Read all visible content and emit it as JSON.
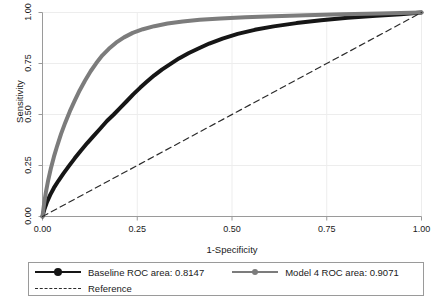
{
  "chart_data": {
    "type": "line",
    "title": "",
    "xlabel": "1-Specificity",
    "ylabel": "Sensitivity",
    "xlim": [
      0,
      1
    ],
    "ylim": [
      0,
      1
    ],
    "xticks": [
      "0.00",
      "0.25",
      "0.50",
      "0.75",
      "1.00"
    ],
    "xtick_values": [
      0,
      0.25,
      0.5,
      0.75,
      1
    ],
    "yticks": [
      "0.00",
      "0.25",
      "0.50",
      "0.75",
      "1.00"
    ],
    "ytick_values": [
      0,
      0.25,
      0.5,
      0.75,
      1
    ],
    "grid": true,
    "legend_position": "below",
    "series": [
      {
        "name": "Baseline ROC area: 0.8147",
        "area": 0.8147,
        "color": "#161616",
        "style": "solid",
        "marker": "circle",
        "x": [
          0.0,
          0.005,
          0.012,
          0.02,
          0.03,
          0.042,
          0.055,
          0.07,
          0.085,
          0.1,
          0.118,
          0.135,
          0.152,
          0.17,
          0.188,
          0.205,
          0.222,
          0.24,
          0.258,
          0.275,
          0.295,
          0.315,
          0.338,
          0.36,
          0.385,
          0.41,
          0.44,
          0.475,
          0.515,
          0.56,
          0.61,
          0.67,
          0.735,
          0.805,
          0.88,
          0.945,
          1.0
        ],
        "y": [
          0.0,
          0.035,
          0.072,
          0.105,
          0.14,
          0.175,
          0.21,
          0.248,
          0.285,
          0.32,
          0.36,
          0.395,
          0.43,
          0.468,
          0.5,
          0.533,
          0.565,
          0.6,
          0.632,
          0.66,
          0.692,
          0.72,
          0.748,
          0.775,
          0.8,
          0.822,
          0.848,
          0.872,
          0.895,
          0.915,
          0.932,
          0.948,
          0.962,
          0.974,
          0.984,
          0.992,
          1.0
        ]
      },
      {
        "name": "Model 4 ROC area: 0.9071",
        "area": 0.9071,
        "color": "#7c7c7c",
        "style": "solid",
        "marker": "circle",
        "x": [
          0.0,
          0.004,
          0.009,
          0.015,
          0.022,
          0.03,
          0.039,
          0.049,
          0.06,
          0.072,
          0.085,
          0.098,
          0.112,
          0.127,
          0.142,
          0.158,
          0.175,
          0.194,
          0.215,
          0.238,
          0.265,
          0.295,
          0.33,
          0.37,
          0.415,
          0.47,
          0.535,
          0.61,
          0.695,
          0.79,
          0.89,
          1.0
        ],
        "y": [
          0.0,
          0.06,
          0.12,
          0.178,
          0.235,
          0.292,
          0.348,
          0.405,
          0.46,
          0.515,
          0.568,
          0.618,
          0.665,
          0.712,
          0.752,
          0.79,
          0.822,
          0.852,
          0.878,
          0.9,
          0.918,
          0.933,
          0.946,
          0.956,
          0.964,
          0.971,
          0.977,
          0.982,
          0.987,
          0.991,
          0.995,
          1.0
        ]
      },
      {
        "name": "Reference",
        "color": "#2b2b2b",
        "style": "dashed",
        "marker": "none",
        "x": [
          0,
          1
        ],
        "y": [
          0,
          1
        ]
      }
    ]
  },
  "legend": {
    "entries": [
      {
        "label": "Baseline ROC area: 0.8147"
      },
      {
        "label": "Model 4 ROC area: 0.9071"
      },
      {
        "label": "Reference"
      }
    ]
  },
  "axes": {
    "x_title": "1-Specificity",
    "y_title": "Sensitivity",
    "x_tick_labels": [
      "0.00",
      "0.25",
      "0.50",
      "0.75",
      "1.00"
    ],
    "y_tick_labels": [
      "0.00",
      "0.25",
      "0.50",
      "0.75",
      "1.00"
    ]
  }
}
